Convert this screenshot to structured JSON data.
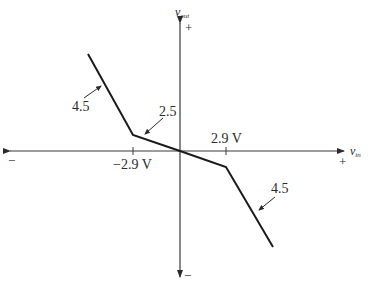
{
  "diagram": {
    "type": "piecewise-linear transfer characteristic",
    "x_axis": {
      "name": "v",
      "subscript": "in",
      "neg_sign": "−",
      "pos_sign": "+"
    },
    "y_axis": {
      "name": "v",
      "subscript": "out",
      "neg_sign": "−",
      "pos_sign": "+"
    },
    "tick_labels": {
      "left": "−2.9 V",
      "right": "2.9 V"
    },
    "slope_labels": {
      "upper_left": "4.5",
      "middle": "2.5",
      "lower_right": "4.5"
    },
    "breakpoints_vin": [
      -2.9,
      2.9
    ],
    "slopes": {
      "outer": -4.5,
      "middle": -2.5
    },
    "colors": {
      "line": "#1a1a1a",
      "axis": "#3a3a3a",
      "text": "#2a2a2a"
    }
  }
}
